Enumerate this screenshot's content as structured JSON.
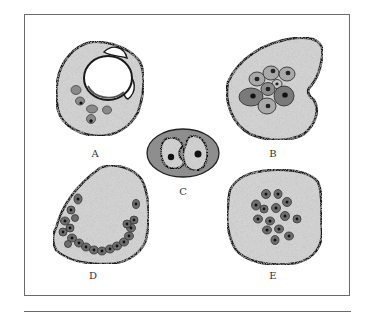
{
  "figure": {
    "panels": [
      {
        "id": "A",
        "label": "A",
        "description": "Cell with large clear vacuole and few small peripheral cells/nuclei"
      },
      {
        "id": "B",
        "label": "B",
        "description": "Large cell with central cluster of nucleated cells"
      },
      {
        "id": "C",
        "label": "C",
        "description": "Small oval cell containing two nucleated bodies (binucleate/dividing)"
      },
      {
        "id": "D",
        "label": "D",
        "description": "Large cell with horseshoe/crescent arrangement of dark nucleated cells along periphery"
      },
      {
        "id": "E",
        "label": "E",
        "description": "Large cell with scattered central cluster of dark nucleated cells"
      }
    ],
    "colors": {
      "cytoplasm": "#d2d2d2",
      "outline": "#1a1a1a",
      "inclusion_light": "#a9a9a9",
      "inclusion_dark": "#707070",
      "nucleus": "#111111",
      "vacuole": "#ffffff",
      "frame": "#6a6a6a"
    }
  }
}
